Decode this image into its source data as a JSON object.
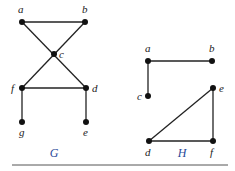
{
  "colors": {
    "label_blue": "#2a4a9a",
    "ink": "#222222",
    "rule": "#555555"
  },
  "graphs": [
    {
      "name": "G",
      "label_pos": [
        54,
        157
      ],
      "vertices": [
        {
          "id": "a",
          "x": 22,
          "y": 22,
          "lx": 18,
          "ly": 13
        },
        {
          "id": "b",
          "x": 85,
          "y": 22,
          "lx": 82,
          "ly": 13
        },
        {
          "id": "c",
          "x": 54,
          "y": 54,
          "lx": 59,
          "ly": 58
        },
        {
          "id": "f",
          "x": 22,
          "y": 88,
          "lx": 11,
          "ly": 92
        },
        {
          "id": "d",
          "x": 86,
          "y": 88,
          "lx": 92,
          "ly": 92
        },
        {
          "id": "g",
          "x": 22,
          "y": 122,
          "lx": 19,
          "ly": 136
        },
        {
          "id": "e",
          "x": 86,
          "y": 122,
          "lx": 83,
          "ly": 136
        }
      ],
      "edges": [
        [
          "a",
          "b"
        ],
        [
          "a",
          "d"
        ],
        [
          "b",
          "f"
        ],
        [
          "f",
          "d"
        ],
        [
          "f",
          "g"
        ],
        [
          "d",
          "e"
        ]
      ]
    },
    {
      "name": "H",
      "label_pos": [
        182,
        157
      ],
      "vertices": [
        {
          "id": "a",
          "x": 148,
          "y": 61,
          "lx": 145,
          "ly": 52
        },
        {
          "id": "b",
          "x": 212,
          "y": 61,
          "lx": 209,
          "ly": 52
        },
        {
          "id": "c",
          "x": 148,
          "y": 96,
          "lx": 137,
          "ly": 100
        },
        {
          "id": "e",
          "x": 213,
          "y": 88,
          "lx": 219,
          "ly": 92
        },
        {
          "id": "d",
          "x": 149,
          "y": 141,
          "lx": 145,
          "ly": 156
        },
        {
          "id": "f",
          "x": 213,
          "y": 141,
          "lx": 210,
          "ly": 156
        }
      ],
      "edges": [
        [
          "a",
          "b"
        ],
        [
          "a",
          "c"
        ],
        [
          "d",
          "e"
        ],
        [
          "e",
          "f"
        ],
        [
          "d",
          "f"
        ]
      ]
    }
  ],
  "rule": {
    "x1": 12,
    "x2": 228,
    "y": 165
  }
}
